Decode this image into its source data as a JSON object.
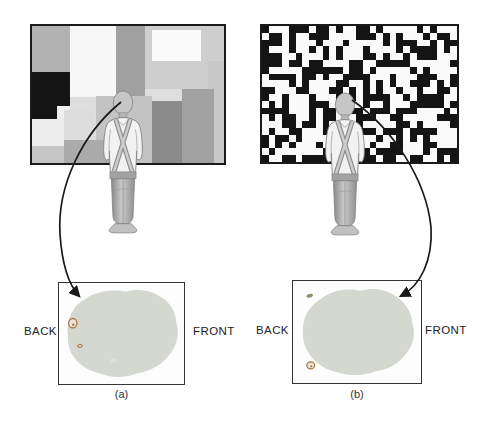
{
  "panels": [
    {
      "caption": "(a)",
      "back_label": "BACK",
      "front_label": "FRONT"
    },
    {
      "caption": "(b)",
      "back_label": "BACK",
      "front_label": "FRONT"
    }
  ],
  "palette": {
    "background": "#ffffff",
    "screen_border": "#1a1a1a",
    "mondrian_bg": "#dedede",
    "noise_black": "#141414",
    "noise_white": "#fafafa",
    "brain_fill": "#d4d8d0",
    "brain_spot_ring": "#ad763e",
    "brain_spot_fill": "#e9e5d8",
    "arrow_color": "#1a1a1a",
    "label_color": "#222222",
    "box_border": "#333333",
    "person_skin": "#c6c6c6",
    "person_shirt": "#f2f2f2",
    "person_outline": "#808080"
  },
  "mondrian": {
    "bg": "#dedede",
    "blocks": [
      {
        "x": 0,
        "y": 0,
        "w": 38,
        "h": 46,
        "c": "#b3b3b3"
      },
      {
        "x": 38,
        "y": 0,
        "w": 46,
        "h": 71,
        "c": "#f6f6f6"
      },
      {
        "x": 84,
        "y": 0,
        "w": 29,
        "h": 80,
        "c": "#a0a0a0"
      },
      {
        "x": 113,
        "y": 0,
        "w": 79,
        "h": 63,
        "c": "#cecece"
      },
      {
        "x": 120,
        "y": 4,
        "w": 49,
        "h": 31,
        "c": "#fbfbfb"
      },
      {
        "x": 176,
        "y": 35,
        "w": 16,
        "h": 102,
        "c": "#c8c8c8"
      },
      {
        "x": 0,
        "y": 46,
        "w": 38,
        "h": 34,
        "c": "#141414"
      },
      {
        "x": 0,
        "y": 80,
        "w": 25,
        "h": 13,
        "c": "#141414"
      },
      {
        "x": 25,
        "y": 80,
        "w": 13,
        "h": 13,
        "c": "#efefef"
      },
      {
        "x": 0,
        "y": 93,
        "w": 32,
        "h": 27,
        "c": "#ededed"
      },
      {
        "x": 0,
        "y": 120,
        "w": 34,
        "h": 17,
        "c": "#c6c6c6"
      },
      {
        "x": 32,
        "y": 84,
        "w": 30,
        "h": 36,
        "c": "#dcdcdc"
      },
      {
        "x": 64,
        "y": 70,
        "w": 56,
        "h": 67,
        "c": "#c3c3c3"
      },
      {
        "x": 32,
        "y": 114,
        "w": 66,
        "h": 23,
        "c": "#ababab"
      },
      {
        "x": 120,
        "y": 75,
        "w": 30,
        "h": 62,
        "c": "#8b8b8b"
      },
      {
        "x": 150,
        "y": 63,
        "w": 32,
        "h": 74,
        "c": "#a2a2a2"
      }
    ]
  },
  "noise": {
    "cols": 29,
    "rows": 20,
    "seed": 1234,
    "black_fraction": 0.47
  }
}
